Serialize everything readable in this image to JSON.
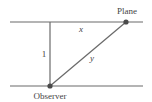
{
  "diagram": {
    "labels": {
      "plane": "Plane",
      "observer": "Observer",
      "horizontal_distance": "x",
      "vertical_distance": "1",
      "hypotenuse": "y"
    },
    "colors": {
      "line": "#6b6b6b",
      "point": "#4a4a4a",
      "text": "#444444"
    }
  }
}
